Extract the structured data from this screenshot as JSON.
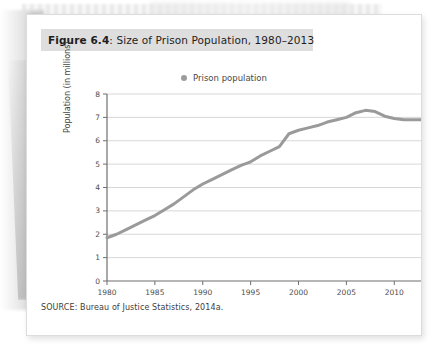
{
  "figure": {
    "number_label": "Figure 6.4",
    "title_rest": ": Size of Prison Population, 1980–2013",
    "source": "SOURCE: Bureau of Justice Statistics, 2014a."
  },
  "legend": {
    "label": "Prison population",
    "marker_color": "#9c9c9c"
  },
  "colors": {
    "line": "#9a9a9a",
    "grid": "#d7d7d7",
    "axis": "#6f6f6f",
    "title_band": "#dedede"
  },
  "chart_data": {
    "type": "line",
    "title": "Figure 6.4: Size of Prison Population, 1980–2013",
    "xlabel": "",
    "ylabel": "Population (in millions)",
    "xlim": [
      1980,
      2013
    ],
    "ylim": [
      0,
      8
    ],
    "grid": true,
    "legend_position": "top-center",
    "xticks": [
      1980,
      1985,
      1990,
      1995,
      2000,
      2005,
      2010
    ],
    "yticks": [
      0,
      1,
      2,
      3,
      4,
      5,
      6,
      7,
      8
    ],
    "series": [
      {
        "name": "Prison population",
        "color": "#9a9a9a",
        "x": [
          1980,
          1981,
          1982,
          1983,
          1984,
          1985,
          1986,
          1987,
          1988,
          1989,
          1990,
          1991,
          1992,
          1993,
          1994,
          1995,
          1996,
          1997,
          1998,
          1999,
          2000,
          2001,
          2002,
          2003,
          2004,
          2005,
          2006,
          2007,
          2008,
          2009,
          2010,
          2011,
          2012,
          2013
        ],
        "values": [
          1.85,
          2.0,
          2.2,
          2.4,
          2.6,
          2.8,
          3.05,
          3.3,
          3.6,
          3.9,
          4.15,
          4.35,
          4.55,
          4.75,
          4.95,
          5.1,
          5.35,
          5.55,
          5.75,
          6.3,
          6.45,
          6.55,
          6.65,
          6.8,
          6.9,
          7.0,
          7.2,
          7.3,
          7.25,
          7.05,
          6.95,
          6.9,
          6.9,
          6.9
        ]
      }
    ]
  }
}
